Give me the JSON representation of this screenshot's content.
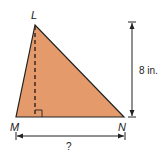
{
  "diagram": {
    "type": "triangle",
    "fill_color": "#e59a6c",
    "stroke_color": "#222222",
    "vertices": {
      "L": {
        "label": "L",
        "x": 35,
        "y": 25
      },
      "M": {
        "label": "M",
        "x": 16,
        "y": 117
      },
      "N": {
        "label": "N",
        "x": 124,
        "y": 117
      }
    },
    "height": {
      "label": "8 in.",
      "value": 8,
      "unit": "in."
    },
    "base": {
      "label": "?"
    },
    "right_angle_marker": true
  }
}
